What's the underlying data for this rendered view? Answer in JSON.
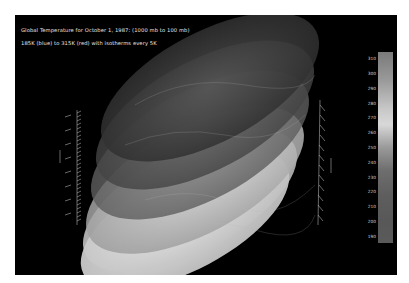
{
  "figure": {
    "title_line1": "Global Temperature for October 1, 1987: (1000 mb to 100 mb)",
    "title_line2": "185K (blue) to 315K (red) with isotherms every 5K"
  },
  "colorbar": {
    "labels": [
      "310",
      "300",
      "290",
      "280",
      "270",
      "260",
      "250",
      "240",
      "230",
      "220",
      "210",
      "200",
      "190"
    ]
  },
  "left_axis": {
    "label": "Pressure"
  },
  "colors": {
    "background": "#000000",
    "frame": "#ffffff"
  }
}
